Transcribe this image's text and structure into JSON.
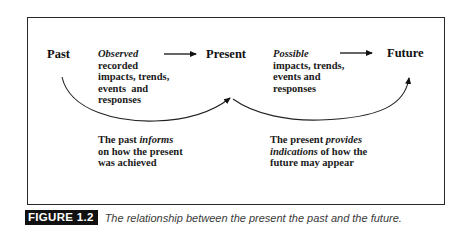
{
  "diagram": {
    "nodes": {
      "past": "Past",
      "present": "Present",
      "future": "Future"
    },
    "observed_block": {
      "emphasis": "Observed",
      "lines": [
        "recorded",
        "impacts, trends,",
        "events  and",
        "responses"
      ]
    },
    "possible_block": {
      "emphasis": "Possible",
      "lines": [
        "impacts, trends,",
        "events and",
        "responses"
      ]
    },
    "past_informs": {
      "line1_prefix": "The past ",
      "line1_emphasis": "informs",
      "line2": "on how the present",
      "line3": "was achieved"
    },
    "present_provides": {
      "line1_prefix": "The present ",
      "line1_emphasis": "provides",
      "line2_emphasis": "indications",
      "line2_suffix": " of how the",
      "line3": "future may appear"
    },
    "arrows": [
      {
        "from": "Observed block",
        "to": "Present",
        "type": "straight"
      },
      {
        "from": "Possible block",
        "to": "Future",
        "type": "straight"
      },
      {
        "from": "Past",
        "to": "Present",
        "type": "curved"
      },
      {
        "from": "Present",
        "to": "Future",
        "type": "curved"
      }
    ]
  },
  "caption": {
    "label": "FIGURE 1.2",
    "text": "The relationship between the present the past and the future."
  }
}
